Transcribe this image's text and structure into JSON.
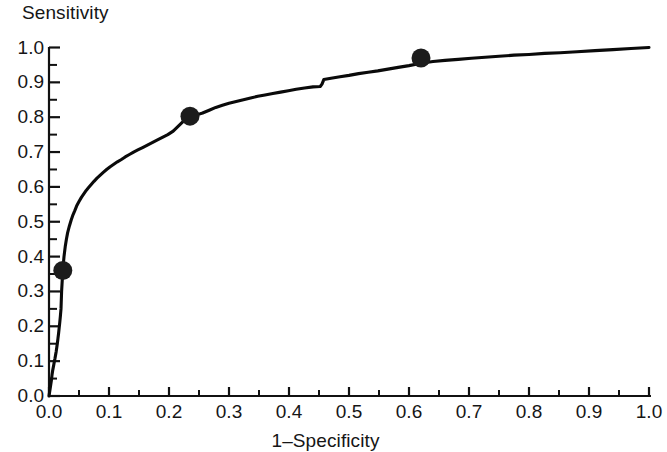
{
  "chart_data": {
    "type": "line",
    "title": "",
    "xlabel": "1–Specificity",
    "ylabel": "Sensitivity",
    "xlim": [
      0.0,
      1.0
    ],
    "ylim": [
      0.0,
      1.0
    ],
    "grid": false,
    "legend": "none",
    "x_tick_labels": [
      "0.0",
      "0.1",
      "0.2",
      "0.3",
      "0.4",
      "0.5",
      "0.6",
      "0.7",
      "0.8",
      "0.9",
      "1.0"
    ],
    "y_tick_labels": [
      "0.0",
      "0.1",
      "0.2",
      "0.3",
      "0.4",
      "0.5",
      "0.6",
      "0.7",
      "0.8",
      "0.9",
      "1.0"
    ],
    "x_tick_values": [
      0.0,
      0.1,
      0.2,
      0.3,
      0.4,
      0.5,
      0.6,
      0.7,
      0.8,
      0.9,
      1.0
    ],
    "y_tick_values": [
      0.0,
      0.1,
      0.2,
      0.3,
      0.4,
      0.5,
      0.6,
      0.7,
      0.8,
      0.9,
      1.0
    ],
    "minor_tick_interval": 0.05,
    "series": [
      {
        "name": "ROC curve",
        "color": "#0a0a0a",
        "x": [
          0.0,
          0.002,
          0.004,
          0.005,
          0.006,
          0.008,
          0.009,
          0.01,
          0.011,
          0.012,
          0.013,
          0.014,
          0.015,
          0.016,
          0.017,
          0.018,
          0.019,
          0.02,
          0.021,
          0.023,
          0.025,
          0.027,
          0.029,
          0.031,
          0.034,
          0.037,
          0.04,
          0.043,
          0.046,
          0.05,
          0.054,
          0.058,
          0.062,
          0.066,
          0.07,
          0.075,
          0.08,
          0.085,
          0.09,
          0.096,
          0.102,
          0.108,
          0.114,
          0.12,
          0.127,
          0.134,
          0.141,
          0.148,
          0.156,
          0.164,
          0.172,
          0.18,
          0.189,
          0.198,
          0.207,
          0.216,
          0.225,
          0.235,
          0.245,
          0.256,
          0.267,
          0.278,
          0.289,
          0.3,
          0.312,
          0.324,
          0.336,
          0.348,
          0.36,
          0.373,
          0.386,
          0.399,
          0.412,
          0.426,
          0.44,
          0.452,
          0.455,
          0.458,
          0.47,
          0.485,
          0.5,
          0.516,
          0.532,
          0.548,
          0.565,
          0.582,
          0.6,
          0.62,
          0.64,
          0.66,
          0.682,
          0.704,
          0.727,
          0.75,
          0.775,
          0.8,
          0.826,
          0.852,
          0.88,
          0.91,
          0.94,
          0.97,
          1.0
        ],
        "y": [
          0.0,
          0.022,
          0.045,
          0.06,
          0.072,
          0.09,
          0.1,
          0.108,
          0.118,
          0.128,
          0.14,
          0.152,
          0.166,
          0.18,
          0.196,
          0.212,
          0.23,
          0.25,
          0.3,
          0.36,
          0.4,
          0.428,
          0.45,
          0.468,
          0.488,
          0.505,
          0.52,
          0.532,
          0.545,
          0.558,
          0.57,
          0.58,
          0.59,
          0.598,
          0.606,
          0.616,
          0.625,
          0.633,
          0.641,
          0.65,
          0.658,
          0.665,
          0.672,
          0.678,
          0.686,
          0.693,
          0.7,
          0.706,
          0.713,
          0.72,
          0.727,
          0.734,
          0.742,
          0.75,
          0.76,
          0.775,
          0.79,
          0.8,
          0.806,
          0.812,
          0.82,
          0.828,
          0.834,
          0.84,
          0.845,
          0.85,
          0.855,
          0.86,
          0.864,
          0.868,
          0.872,
          0.876,
          0.88,
          0.884,
          0.887,
          0.888,
          0.895,
          0.908,
          0.912,
          0.916,
          0.92,
          0.925,
          0.929,
          0.933,
          0.938,
          0.943,
          0.948,
          0.955,
          0.96,
          0.963,
          0.966,
          0.969,
          0.972,
          0.975,
          0.978,
          0.98,
          0.983,
          0.985,
          0.988,
          0.991,
          0.994,
          0.997,
          1.0
        ]
      }
    ],
    "marked_points": [
      {
        "x": 0.023,
        "y": 0.36
      },
      {
        "x": 0.235,
        "y": 0.803
      },
      {
        "x": 0.62,
        "y": 0.97
      }
    ]
  }
}
